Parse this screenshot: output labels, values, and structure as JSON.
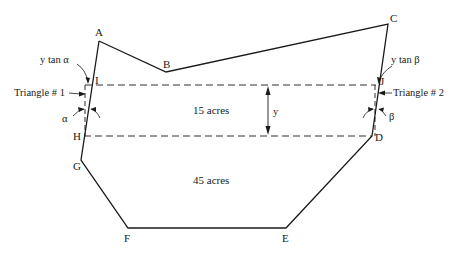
{
  "diagram": {
    "type": "land-parcel-partition",
    "vertices": {
      "A": "A",
      "B": "B",
      "C": "C",
      "D": "D",
      "E": "E",
      "F": "F",
      "G": "G",
      "H": "H",
      "I": "I",
      "J": "J"
    },
    "areas": {
      "upper": "15 acres",
      "lower": "45 acres"
    },
    "annotations": {
      "y_tan_alpha": "y tan α",
      "y_tan_beta": "y tan β",
      "triangle1": "Triangle # 1",
      "triangle2": "Triangle # 2",
      "alpha": "α",
      "beta": "β",
      "y": "y"
    },
    "colors": {
      "line": "#1a1a1a",
      "background": "#ffffff"
    }
  }
}
